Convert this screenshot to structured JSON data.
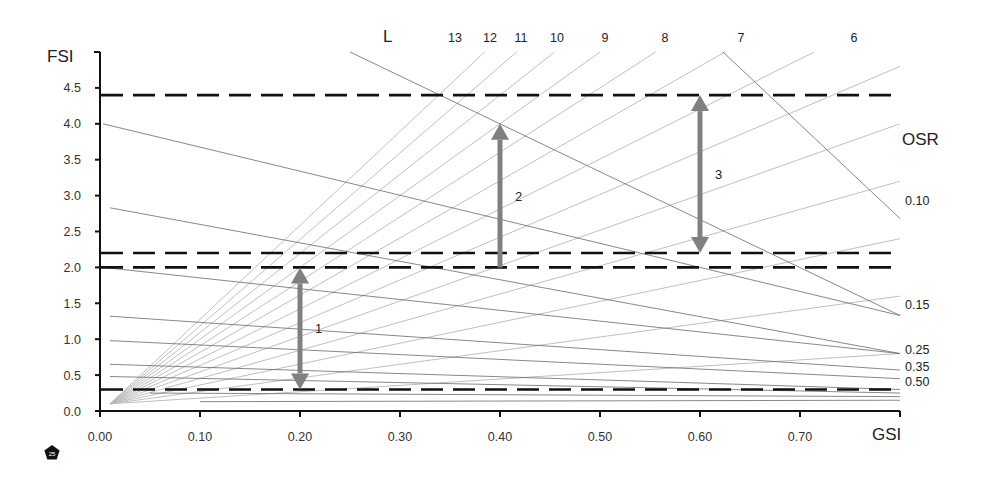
{
  "chart_data": {
    "type": "line",
    "title": "",
    "xlabel": "GSI",
    "ylabel": "FSI",
    "xlim": [
      0.0,
      0.8
    ],
    "ylim": [
      0.0,
      5.0
    ],
    "x_ticks": [
      "0.00",
      "0.10",
      "0.20",
      "0.30",
      "0.40",
      "0.50",
      "0.60",
      "0.70"
    ],
    "y_ticks": [
      "0.0",
      "0.5",
      "1.0",
      "1.5",
      "2.0",
      "2.5",
      "3.0",
      "3.5",
      "4.0",
      "4.5"
    ],
    "grid": false,
    "layers_label": "L",
    "layer_lines": [
      {
        "label": "13",
        "L": 13
      },
      {
        "label": "12",
        "L": 12
      },
      {
        "label": "11",
        "L": 11
      },
      {
        "label": "10",
        "L": 10
      },
      {
        "label": "9",
        "L": 9
      },
      {
        "label": "8",
        "L": 8
      },
      {
        "label": "7",
        "L": 7
      },
      {
        "label": "6",
        "L": 6
      },
      {
        "label": "",
        "L": 5
      },
      {
        "label": "",
        "L": 4
      },
      {
        "label": "",
        "L": 3
      },
      {
        "label": "",
        "L": 2
      },
      {
        "label": "",
        "L": 1
      }
    ],
    "osr_label": "OSR",
    "osr_lines": [
      {
        "label": "0.10",
        "points": [
          [
            0.623,
            5.0
          ],
          [
            0.8,
            2.68
          ]
        ]
      },
      {
        "label": "",
        "points": [
          [
            0.25,
            5.0
          ],
          [
            0.8,
            1.33
          ]
        ]
      },
      {
        "label": "0.15",
        "points": [
          [
            0.003,
            4.0
          ],
          [
            0.8,
            1.33
          ]
        ]
      },
      {
        "label": "",
        "points": [
          [
            0.01,
            2.83
          ],
          [
            0.8,
            0.8
          ]
        ]
      },
      {
        "label": "0.25",
        "points": [
          [
            0.003,
            2.0
          ],
          [
            0.8,
            0.8
          ]
        ]
      },
      {
        "label": "0.35",
        "points": [
          [
            0.01,
            1.32
          ],
          [
            0.8,
            0.57
          ]
        ]
      },
      {
        "label": "0.50",
        "points": [
          [
            0.01,
            0.98
          ],
          [
            0.8,
            0.45
          ]
        ]
      },
      {
        "label": "",
        "points": [
          [
            0.01,
            0.65
          ],
          [
            0.8,
            0.3
          ]
        ]
      },
      {
        "label": "",
        "points": [
          [
            0.01,
            0.48
          ],
          [
            0.8,
            0.25
          ]
        ]
      },
      {
        "label": "",
        "points": [
          [
            0.05,
            0.25
          ],
          [
            0.8,
            0.2
          ]
        ]
      },
      {
        "label": "",
        "points": [
          [
            0.1,
            0.13
          ],
          [
            0.8,
            0.15
          ]
        ]
      }
    ],
    "threshold_lines": [
      {
        "fsi": 4.4,
        "style": "dashed"
      },
      {
        "fsi": 2.2,
        "style": "dashed"
      },
      {
        "fsi": 2.0,
        "style": "dashed"
      },
      {
        "fsi": 0.3,
        "style": "dashed"
      }
    ],
    "annotations": [
      {
        "label": "1",
        "gsi": 0.2,
        "from_fsi": 0.3,
        "to_fsi": 2.0,
        "direction": "both"
      },
      {
        "label": "2",
        "gsi": 0.4,
        "from_fsi": 2.0,
        "to_fsi": 4.0,
        "direction": "up"
      },
      {
        "label": "3",
        "gsi": 0.6,
        "from_fsi": 2.2,
        "to_fsi": 4.4,
        "direction": "both"
      }
    ]
  },
  "badge": {
    "label": "25"
  },
  "colors": {
    "axis": "#111111",
    "dashed": "#111111",
    "fan": "#b8b8b8",
    "osr": "#6a6a6a",
    "arrow": "#808080"
  }
}
